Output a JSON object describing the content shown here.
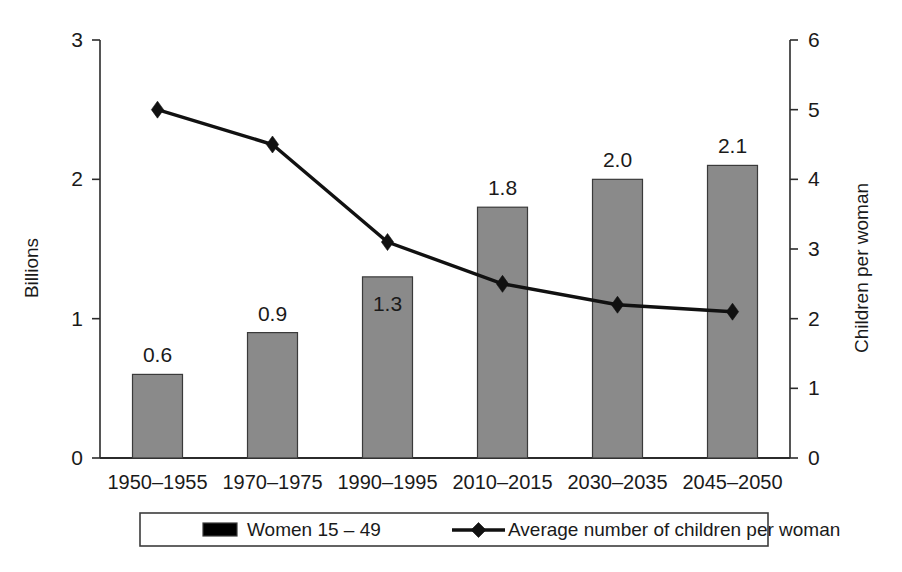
{
  "chart_data": {
    "type": "bar",
    "title": "",
    "subtitle": "",
    "categories": [
      "1950–1955",
      "1970–1975",
      "1990–1995",
      "2010–2015",
      "2030–2035",
      "2045–2050"
    ],
    "series": [
      {
        "name": "Women 15 – 49",
        "type": "bar",
        "axis": "left",
        "values": [
          0.6,
          0.9,
          1.3,
          1.8,
          2.0,
          2.1
        ],
        "data_labels": [
          "0.6",
          "0.9",
          "1.3",
          "1.8",
          "2.0",
          "2.1"
        ],
        "label_positions": [
          "outside",
          "outside",
          "inside",
          "outside",
          "outside",
          "outside"
        ],
        "color": "#8a8a8a"
      },
      {
        "name": "Average number of children per woman",
        "type": "line",
        "axis": "right",
        "values": [
          5.0,
          4.5,
          3.1,
          2.5,
          2.2,
          2.1
        ],
        "color": "#111111",
        "marker": "diamond"
      }
    ],
    "left_axis": {
      "label": "Billions",
      "ticks": [
        "0",
        "1",
        "2",
        "3"
      ],
      "tick_values": [
        0,
        1,
        2,
        3
      ],
      "ylim": [
        0,
        3
      ]
    },
    "right_axis": {
      "label": "Children per woman",
      "ticks": [
        "0",
        "1",
        "2",
        "3",
        "4",
        "5",
        "6"
      ],
      "tick_values": [
        0,
        1,
        2,
        3,
        4,
        5,
        6
      ],
      "ylim": [
        0,
        6
      ]
    },
    "xlabel": "",
    "grid": false,
    "legend": {
      "position": "bottom",
      "entries": [
        {
          "label": "Women 15 – 49",
          "marker": "swatch",
          "color": "#8a8a8a"
        },
        {
          "label": "Average number of children per woman",
          "marker": "line-diamond",
          "color": "#111111"
        }
      ]
    }
  },
  "colors": {
    "bar_fill": "#8a8a8a",
    "bar_stroke": "#3a3a3a",
    "line": "#111111",
    "axis": "#2b2b2b",
    "background": "#ffffff"
  }
}
